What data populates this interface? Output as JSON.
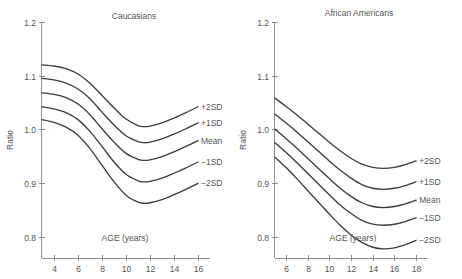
{
  "figure": {
    "background": "#ffffff",
    "curve_color": "#3d3d3d",
    "axis_color": "#8c8c8c",
    "text_color": "#555555"
  },
  "chart_data": [
    {
      "type": "line",
      "title": "Caucasians",
      "xlabel": "AGE (years)",
      "ylabel": "Ratio",
      "xlim": [
        3,
        17
      ],
      "ylim": [
        0.76,
        1.2
      ],
      "xticks": [
        4,
        6,
        8,
        10,
        12,
        14,
        16
      ],
      "xticklabels": [
        "4",
        "6",
        "8",
        "10",
        "12",
        "14",
        "16"
      ],
      "yticks": [
        0.8,
        0.9,
        1.0,
        1.1,
        1.2
      ],
      "yticklabels": [
        "0.8",
        "0.9",
        "1.0",
        "1.1",
        "1.2"
      ],
      "grid": false,
      "legend": "inline-right-end-labels",
      "x": [
        3.0,
        4.0,
        5.0,
        6.0,
        7.0,
        8.0,
        9.0,
        10.0,
        11.0,
        11.5,
        12.0,
        13.0,
        14.0,
        15.0,
        16.0
      ],
      "series": [
        {
          "name": "+2SD",
          "label": "+2SD",
          "values": [
            1.12,
            1.118,
            1.113,
            1.103,
            1.086,
            1.063,
            1.04,
            1.019,
            1.007,
            1.005,
            1.006,
            1.012,
            1.021,
            1.031,
            1.042
          ]
        },
        {
          "name": "+1SD",
          "label": "+1SD",
          "values": [
            1.095,
            1.092,
            1.086,
            1.075,
            1.057,
            1.032,
            1.008,
            0.988,
            0.977,
            0.975,
            0.976,
            0.982,
            0.991,
            1.001,
            1.012
          ]
        },
        {
          "name": "Mean",
          "label": "Mean",
          "values": [
            1.068,
            1.065,
            1.059,
            1.047,
            1.027,
            1.001,
            0.976,
            0.955,
            0.944,
            0.942,
            0.943,
            0.949,
            0.958,
            0.968,
            0.979
          ]
        },
        {
          "name": "-1SD",
          "label": "−1SD",
          "values": [
            1.042,
            1.038,
            1.031,
            1.018,
            0.996,
            0.968,
            0.939,
            0.916,
            0.904,
            0.902,
            0.903,
            0.909,
            0.918,
            0.928,
            0.939
          ]
        },
        {
          "name": "-2SD",
          "label": "−2SD",
          "values": [
            1.018,
            1.013,
            1.004,
            0.989,
            0.964,
            0.933,
            0.902,
            0.877,
            0.864,
            0.862,
            0.863,
            0.869,
            0.878,
            0.888,
            0.899
          ]
        }
      ]
    },
    {
      "type": "line",
      "title": "African Americans",
      "xlabel": "AGE (years)",
      "ylabel": "Ratio",
      "xlim": [
        5,
        19
      ],
      "ylim": [
        0.76,
        1.2
      ],
      "xticks": [
        6,
        8,
        10,
        12,
        14,
        16,
        18
      ],
      "xticklabels": [
        "6",
        "8",
        "10",
        "12",
        "14",
        "16",
        "18"
      ],
      "yticks": [
        0.8,
        0.9,
        1.0,
        1.1,
        1.2
      ],
      "yticklabels": [
        "0.8",
        "0.9",
        "1.0",
        "1.1",
        "1.2"
      ],
      "grid": false,
      "legend": "inline-right-end-labels",
      "x": [
        5.0,
        6.0,
        7.0,
        8.0,
        9.0,
        10.0,
        11.0,
        12.0,
        13.0,
        14.0,
        15.0,
        16.0,
        17.0,
        18.0
      ],
      "series": [
        {
          "name": "+2SD",
          "label": "+2SD",
          "values": [
            1.058,
            1.043,
            1.027,
            1.01,
            0.993,
            0.976,
            0.96,
            0.946,
            0.935,
            0.929,
            0.927,
            0.929,
            0.934,
            0.941
          ]
        },
        {
          "name": "+1SD",
          "label": "+1SD",
          "values": [
            1.028,
            1.012,
            0.995,
            0.977,
            0.959,
            0.941,
            0.924,
            0.909,
            0.897,
            0.89,
            0.888,
            0.89,
            0.895,
            0.902
          ]
        },
        {
          "name": "Mean",
          "label": "Mean",
          "values": [
            1.0,
            0.983,
            0.965,
            0.946,
            0.927,
            0.908,
            0.89,
            0.875,
            0.863,
            0.856,
            0.854,
            0.856,
            0.861,
            0.868
          ]
        },
        {
          "name": "-1SD",
          "label": "−1SD",
          "values": [
            0.975,
            0.957,
            0.938,
            0.918,
            0.898,
            0.878,
            0.859,
            0.843,
            0.83,
            0.823,
            0.821,
            0.823,
            0.828,
            0.835
          ]
        },
        {
          "name": "-2SD",
          "label": "−2SD",
          "values": [
            0.948,
            0.929,
            0.908,
            0.886,
            0.864,
            0.842,
            0.821,
            0.803,
            0.789,
            0.78,
            0.777,
            0.779,
            0.785,
            0.793
          ]
        }
      ]
    }
  ]
}
